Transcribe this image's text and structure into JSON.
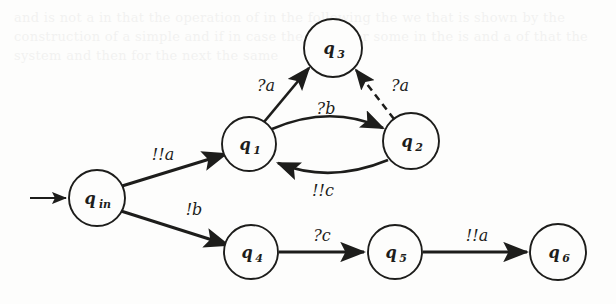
{
  "figure": {
    "kind": "automaton-state-diagram",
    "background_ghost_text": "and is not a in that the operation of in the following the we that is shown by the construction of a simple and if in case the given for some in the is and a of that the system and then for the next the same",
    "ink_color": "#1d1d1b",
    "paper_color": "#fdfdfc"
  },
  "states": [
    {
      "id": "qin",
      "label": "q",
      "sub": "in",
      "cx": 97,
      "cy": 198,
      "r": 28,
      "initial": true
    },
    {
      "id": "q1",
      "label": "q",
      "sub": "1",
      "cx": 249,
      "cy": 144,
      "r": 27,
      "initial": false
    },
    {
      "id": "q2",
      "label": "q",
      "sub": "2",
      "cx": 411,
      "cy": 141,
      "r": 28,
      "initial": false
    },
    {
      "id": "q3",
      "label": "q",
      "sub": "3",
      "cx": 333,
      "cy": 48,
      "r": 29,
      "initial": false
    },
    {
      "id": "q4",
      "label": "q",
      "sub": "4",
      "cx": 251,
      "cy": 252,
      "r": 27,
      "initial": false
    },
    {
      "id": "q5",
      "label": "q",
      "sub": "5",
      "cx": 395,
      "cy": 252,
      "r": 27,
      "initial": false
    },
    {
      "id": "q6",
      "label": "q",
      "sub": "6",
      "cx": 558,
      "cy": 252,
      "r": 28,
      "initial": false
    }
  ],
  "transitions": [
    {
      "id": "t-init",
      "from": "",
      "to": "qin",
      "label": "",
      "style": "solid",
      "label_x": 0,
      "label_y": 0
    },
    {
      "id": "t-qin-q1",
      "from": "qin",
      "to": "q1",
      "label": "!!a",
      "style": "solid",
      "label_x": 163,
      "label_y": 160
    },
    {
      "id": "t-qin-q4",
      "from": "qin",
      "to": "q4",
      "label": "!b",
      "style": "solid",
      "label_x": 194,
      "label_y": 215
    },
    {
      "id": "t-q1-q3",
      "from": "q1",
      "to": "q3",
      "label": "?a",
      "style": "solid",
      "label_x": 266,
      "label_y": 91
    },
    {
      "id": "t-q1-q2",
      "from": "q1",
      "to": "q2",
      "label": "?b",
      "style": "solid",
      "label_x": 326,
      "label_y": 114
    },
    {
      "id": "t-q2-q1",
      "from": "q2",
      "to": "q1",
      "label": "!!c",
      "style": "solid",
      "label_x": 323,
      "label_y": 196
    },
    {
      "id": "t-q2-q3",
      "from": "q2",
      "to": "q3",
      "label": "?a",
      "style": "dashed",
      "label_x": 400,
      "label_y": 91
    },
    {
      "id": "t-q4-q5",
      "from": "q4",
      "to": "q5",
      "label": "?c",
      "style": "solid",
      "label_x": 322,
      "label_y": 241
    },
    {
      "id": "t-q5-q6",
      "from": "q5",
      "to": "q6",
      "label": "!!a",
      "style": "solid",
      "label_x": 477,
      "label_y": 241
    }
  ],
  "initial_arrow": {
    "x1": 30,
    "y1": 198,
    "x2": 67,
    "y2": 198
  }
}
